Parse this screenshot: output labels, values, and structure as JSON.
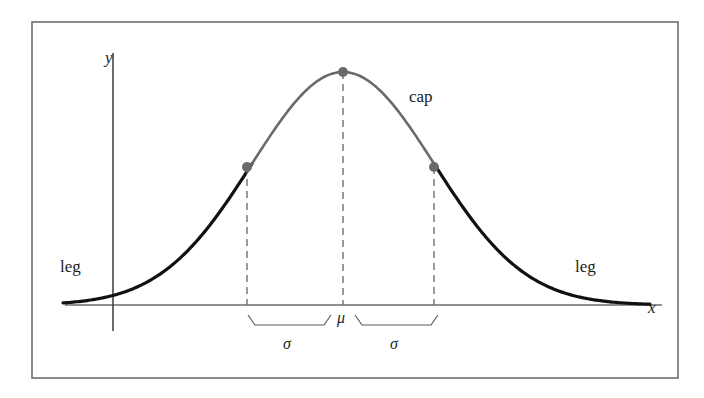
{
  "figure": {
    "type": "normal-distribution-diagram",
    "background_color": "#ffffff",
    "frame": {
      "name": "figure-border",
      "color": "#6e6e6e",
      "x": 32,
      "y": 22,
      "width": 646,
      "height": 356
    },
    "axes": {
      "x_axis": {
        "label": "x",
        "color": "#6b6b6b",
        "y_pixel": 305,
        "x_start": 65,
        "x_end": 662,
        "label_x": 648,
        "label_y": 313
      },
      "y_axis": {
        "label": "y",
        "color": "#3a3a3a",
        "x_pixel": 113,
        "y_start": 53,
        "y_end": 331,
        "label_x": 105,
        "label_y": 63
      }
    },
    "curve": {
      "leg_color": "#111111",
      "cap_color": "#6a6a6a",
      "stroke_width_leg": 3.2,
      "stroke_width_cap": 2.6,
      "mu_pixel": 343,
      "sigma_pixel": 91,
      "peak_y_pixel": 72,
      "baseline_y_pixel": 305,
      "x_domain_start": 63,
      "x_domain_end": 650
    },
    "markers": {
      "color": "#6a6a6a",
      "radius": 5,
      "points": [
        {
          "name": "left-inflection-point",
          "x": 247,
          "y": 167
        },
        {
          "name": "peak-point",
          "x": 343,
          "y": 72
        },
        {
          "name": "right-inflection-point",
          "x": 434,
          "y": 167
        }
      ]
    },
    "dashed_lines": {
      "color": "#707070",
      "dash": "7 5",
      "lines": [
        {
          "name": "left-inflection-dashed-line",
          "x": 247,
          "y_top": 167,
          "y_bottom": 305
        },
        {
          "name": "mean-dashed-line",
          "x": 343,
          "y_top": 72,
          "y_bottom": 305
        },
        {
          "name": "right-inflection-dashed-line",
          "x": 434,
          "y_top": 167,
          "y_bottom": 305
        }
      ]
    },
    "braces": {
      "color": "#5d5d5d",
      "left": {
        "x_start": 248,
        "x_end": 331,
        "y": 325,
        "tick_height": 10
      },
      "right": {
        "x_start": 355,
        "x_end": 438,
        "y": 325,
        "tick_height": 10
      }
    },
    "labels": [
      {
        "name": "leg-label-left",
        "text": "leg",
        "x": 60,
        "y": 272,
        "style": "plain"
      },
      {
        "name": "cap-label",
        "text": "cap",
        "x": 409,
        "y": 102,
        "style": "plain"
      },
      {
        "name": "leg-label-right",
        "text": "leg",
        "x": 575,
        "y": 272,
        "style": "plain"
      },
      {
        "name": "mu-label",
        "text": "μ",
        "x": 337,
        "y": 323,
        "style": "greek"
      },
      {
        "name": "sigma-label-left",
        "text": "σ",
        "x": 283,
        "y": 349,
        "style": "greek"
      },
      {
        "name": "sigma-label-right",
        "text": "σ",
        "x": 390,
        "y": 349,
        "style": "greek"
      }
    ]
  },
  "chart_data": {
    "type": "line",
    "title": "",
    "subtitle": "",
    "xlabel": "x",
    "ylabel": "y",
    "grid": false,
    "legend_position": "none",
    "annotations": [
      {
        "text": "cap",
        "meaning": "central portion of the curve between the inflection points",
        "x": 0.9,
        "y": 0.73
      },
      {
        "text": "leg",
        "meaning": "left tail of the curve beyond the inflection point",
        "x": -3.1,
        "y": 0.08
      },
      {
        "text": "leg",
        "meaning": "right tail of the curve beyond the inflection point",
        "x": 2.6,
        "y": 0.08
      },
      {
        "text": "μ",
        "meaning": "mean, located at the peak of the curve",
        "x": 0,
        "y": 0
      },
      {
        "text": "σ",
        "meaning": "standard deviation measured from μ to the left inflection point",
        "x": -0.5,
        "y": 0
      },
      {
        "text": "σ",
        "meaning": "standard deviation measured from μ to the right inflection point",
        "x": 0.5,
        "y": 0
      }
    ],
    "marked_points": [
      {
        "name": "left inflection point",
        "x": -1,
        "y": 0.6065
      },
      {
        "name": "maximum (mean)",
        "x": 0,
        "y": 1.0
      },
      {
        "name": "right inflection point",
        "x": 1,
        "y": 0.6065
      }
    ],
    "x_tick_labels": [
      "μ"
    ],
    "y_tick_labels": [],
    "xlim": [
      -3.07,
      3.37
    ],
    "ylim": [
      0,
      1.08
    ],
    "series": [
      {
        "name": "normal density",
        "formula": "y = exp(-x^2 / 2)",
        "x": [
          -3.0,
          -2.75,
          -2.5,
          -2.25,
          -2.0,
          -1.75,
          -1.5,
          -1.25,
          -1.0,
          -0.75,
          -0.5,
          -0.25,
          0.0,
          0.25,
          0.5,
          0.75,
          1.0,
          1.25,
          1.5,
          1.75,
          2.0,
          2.25,
          2.5,
          2.75,
          3.0
        ],
        "values": [
          0.011,
          0.023,
          0.044,
          0.079,
          0.135,
          0.216,
          0.325,
          0.458,
          0.607,
          0.755,
          0.882,
          0.969,
          1.0,
          0.969,
          0.882,
          0.755,
          0.607,
          0.458,
          0.325,
          0.216,
          0.135,
          0.079,
          0.044,
          0.023,
          0.011
        ]
      }
    ],
    "segments": [
      {
        "name": "leg",
        "role": "left tail",
        "x_range": [
          -3.0,
          -1.0
        ],
        "color": "#111111"
      },
      {
        "name": "cap",
        "role": "central cap",
        "x_range": [
          -1.0,
          1.0
        ],
        "color": "#6a6a6a"
      },
      {
        "name": "leg",
        "role": "right tail",
        "x_range": [
          1.0,
          3.0
        ],
        "color": "#111111"
      }
    ]
  }
}
